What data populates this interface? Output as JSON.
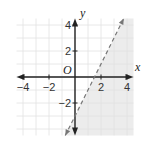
{
  "chart_data": {
    "type": "line",
    "title": "",
    "xlabel": "x",
    "ylabel": "y",
    "origin_label": "O",
    "xlim": [
      -4.5,
      4.5
    ],
    "ylim": [
      -4.5,
      4.5
    ],
    "grid": true,
    "grid_step": 1,
    "x_ticks": [
      {
        "value": -4,
        "label": "−4"
      },
      {
        "value": -2,
        "label": "−2"
      },
      {
        "value": 2,
        "label": "2"
      },
      {
        "value": 4,
        "label": "4"
      }
    ],
    "y_ticks": [
      {
        "value": 4,
        "label": "4"
      },
      {
        "value": 2,
        "label": "2"
      },
      {
        "value": -2,
        "label": "−2"
      }
    ],
    "boundary_line": {
      "equation": "y = 2x - 3",
      "slope": 2,
      "intercept": -3,
      "style": "dashed",
      "x_range": [
        -0.75,
        3.75
      ]
    },
    "inequality": "y < 2x - 3",
    "shaded_region": "below-right of line",
    "colors": {
      "grid": "#e2e2e2",
      "shade": "#ececec",
      "axis": "#222222",
      "boundary": "#777777"
    }
  }
}
